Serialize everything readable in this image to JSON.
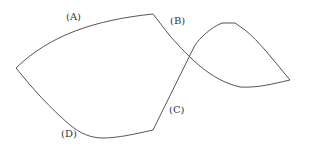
{
  "figure": {
    "labels": {
      "a": "(A)",
      "b": "(B)",
      "c": "(C)",
      "d": "(D)"
    },
    "stroke_color": "#555555",
    "label_color": "#333333"
  }
}
